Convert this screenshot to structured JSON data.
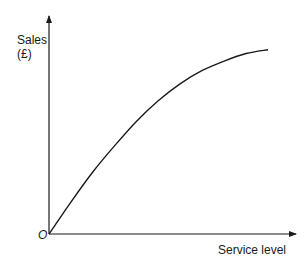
{
  "chart_data": {
    "type": "line",
    "title": "",
    "xlabel": "Service level",
    "ylabel_line1": "Sales",
    "ylabel_line2": "(£)",
    "origin_label": "O",
    "grid": false,
    "legend": null,
    "series": [
      {
        "name": "Sales response",
        "x": [
          0,
          0.1,
          0.2,
          0.3,
          0.4,
          0.5,
          0.6,
          0.7,
          0.8,
          0.9,
          1.0
        ],
        "y": [
          0,
          0.17,
          0.33,
          0.47,
          0.6,
          0.71,
          0.8,
          0.87,
          0.92,
          0.96,
          0.98
        ]
      }
    ],
    "color": "#1a1a1a"
  }
}
